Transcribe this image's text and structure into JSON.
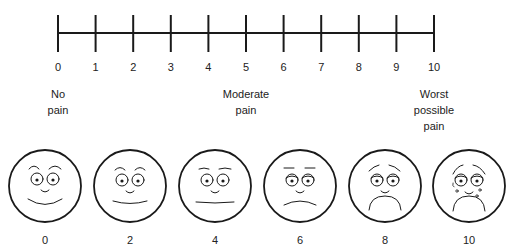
{
  "scale": {
    "ticks": [
      "0",
      "1",
      "2",
      "3",
      "4",
      "5",
      "6",
      "7",
      "8",
      "9",
      "10"
    ],
    "anchors": [
      {
        "value": 0,
        "line1": "No",
        "line2": "pain",
        "line3": ""
      },
      {
        "value": 5,
        "line1": "Moderate",
        "line2": "pain",
        "line3": ""
      },
      {
        "value": 10,
        "line1": "Worst",
        "line2": "possible",
        "line3": "pain"
      }
    ]
  },
  "faces": [
    {
      "label": "0",
      "expression": "big-smile"
    },
    {
      "label": "2",
      "expression": "smile"
    },
    {
      "label": "4",
      "expression": "neutral"
    },
    {
      "label": "6",
      "expression": "slight-frown"
    },
    {
      "label": "8",
      "expression": "frown"
    },
    {
      "label": "10",
      "expression": "crying"
    }
  ],
  "colors": {
    "line": "#1a1a1a",
    "background": "#ffffff"
  }
}
